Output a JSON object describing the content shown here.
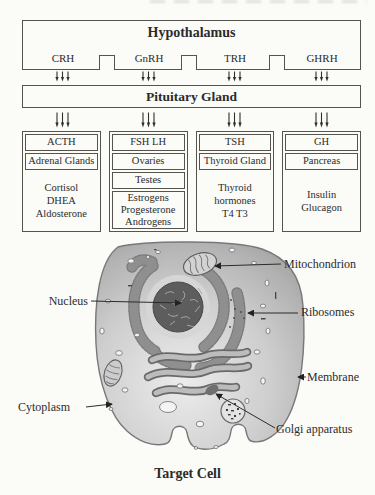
{
  "pathway": {
    "hypothalamus": {
      "title": "Hypothalamus",
      "releasing_hormones": [
        "CRH",
        "GnRH",
        "TRH",
        "GHRH"
      ]
    },
    "pituitary": {
      "title": "Pituitary Gland"
    },
    "columns": [
      {
        "hormone": "ACTH",
        "glands": [
          "Adrenal Glands"
        ],
        "products": [
          "Cortisol",
          "DHEA",
          "Aldosterone"
        ]
      },
      {
        "hormone": "FSH LH",
        "glands": [
          "Ovaries",
          "Testes"
        ],
        "products": [
          "Estrogens",
          "Progesterone",
          "Androgens"
        ]
      },
      {
        "hormone": "TSH",
        "glands": [
          "Thyroid Gland"
        ],
        "products": [
          "Thyroid",
          "hormones",
          "T4 T3"
        ]
      },
      {
        "hormone": "GH",
        "glands": [
          "Pancreas"
        ],
        "products": [
          "Insulin",
          "Glucagon"
        ]
      }
    ]
  },
  "cell": {
    "labels": {
      "nucleus": "Nucleus",
      "mitochondrion": "Mitochondrion",
      "ribosomes": "Ribosomes",
      "membrane": "Membrane",
      "cytoplasm": "Cytoplasm",
      "golgi": "Golgi apparatus"
    },
    "caption": "Target Cell"
  },
  "colors": {
    "ink": "#2b2b2b",
    "box_border": "#56524c",
    "cytoplasm_light": "#eaeaea",
    "cytoplasm_dark": "#9c9c9c",
    "nucleus_fill": "#5d5d5d",
    "er_fill": "#8f8f8f"
  }
}
